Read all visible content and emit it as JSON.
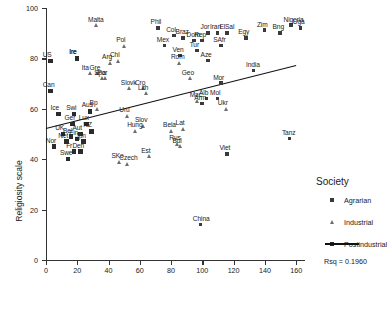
{
  "chart_data": {
    "type": "scatter",
    "title": "",
    "xlabel": "",
    "ylabel": "Religiosity scale",
    "xlim": [
      0,
      165
    ],
    "ylim": [
      0,
      100
    ],
    "xticks": [
      0,
      20,
      40,
      60,
      80,
      100,
      120,
      140,
      160
    ],
    "yticks": [
      0,
      20,
      40,
      60,
      80,
      100
    ],
    "grid": false,
    "legend_position": "right",
    "legend": {
      "title": "Society",
      "entries": [
        {
          "label": "Agrarian",
          "marker": "square-small"
        },
        {
          "label": "Industrial",
          "marker": "triangle"
        },
        {
          "label": "Postindustrial",
          "marker": "square-large"
        }
      ],
      "fit_line": true,
      "rsq_label": "Rsq = 0.1960"
    },
    "series": [
      {
        "name": "Agrarian",
        "marker": "square-small",
        "points": [
          {
            "label": "Phil",
            "x": 72,
            "y": 92
          },
          {
            "label": "Col",
            "x": 82,
            "y": 89
          },
          {
            "label": "Braz",
            "x": 88,
            "y": 88
          },
          {
            "label": "Dom",
            "x": 95,
            "y": 87
          },
          {
            "label": "Rep",
            "x": 100,
            "y": 87
          },
          {
            "label": "Jor",
            "x": 104,
            "y": 90
          },
          {
            "label": "Iran",
            "x": 110,
            "y": 90
          },
          {
            "label": "ElSal",
            "x": 116,
            "y": 90
          },
          {
            "label": "SAfr",
            "x": 112,
            "y": 85
          },
          {
            "label": "Egy",
            "x": 128,
            "y": 88
          },
          {
            "label": "Zim",
            "x": 140,
            "y": 91
          },
          {
            "label": "Bng",
            "x": 150,
            "y": 90
          },
          {
            "label": "Nigeria",
            "x": 157,
            "y": 93
          },
          {
            "label": "Uga",
            "x": 163,
            "y": 92
          },
          {
            "label": "Tur",
            "x": 97,
            "y": 83
          },
          {
            "label": "Mex",
            "x": 76,
            "y": 85
          },
          {
            "label": "Ven",
            "x": 86,
            "y": 81
          },
          {
            "label": "Aze",
            "x": 104,
            "y": 79
          },
          {
            "label": "India",
            "x": 133,
            "y": 75
          },
          {
            "label": "Mor",
            "x": 112,
            "y": 70
          },
          {
            "label": "Alb",
            "x": 103,
            "y": 64
          },
          {
            "label": "Mol",
            "x": 110,
            "y": 64
          },
          {
            "label": "Arm",
            "x": 100,
            "y": 62
          },
          {
            "label": "Viet",
            "x": 116,
            "y": 42
          },
          {
            "label": "China",
            "x": 99,
            "y": 14
          },
          {
            "label": "Tanz",
            "x": 156,
            "y": 48
          },
          {
            "label": "Ire",
            "x": 20,
            "y": 80
          }
        ]
      },
      {
        "name": "Industrial",
        "marker": "triangle",
        "points": [
          {
            "label": "Malta",
            "x": 32,
            "y": 93
          },
          {
            "label": "Pol",
            "x": 50,
            "y": 85
          },
          {
            "label": "Arg",
            "x": 41,
            "y": 78
          },
          {
            "label": "Chl",
            "x": 46,
            "y": 79
          },
          {
            "label": "Rom",
            "x": 85,
            "y": 78
          },
          {
            "label": "Geo",
            "x": 92,
            "y": 72
          },
          {
            "label": "Slovk",
            "x": 53,
            "y": 68
          },
          {
            "label": "Cro",
            "x": 62,
            "y": 68
          },
          {
            "label": "Lith",
            "x": 64,
            "y": 66
          },
          {
            "label": "Mac",
            "x": 97,
            "y": 63
          },
          {
            "label": "Ukr",
            "x": 115,
            "y": 60
          },
          {
            "label": "Uru",
            "x": 52,
            "y": 57
          },
          {
            "label": "Slov",
            "x": 62,
            "y": 53
          },
          {
            "label": "Hung",
            "x": 57,
            "y": 51
          },
          {
            "label": "Bela",
            "x": 80,
            "y": 51
          },
          {
            "label": "Lat",
            "x": 88,
            "y": 52
          },
          {
            "label": "Rus",
            "x": 84,
            "y": 46
          },
          {
            "label": "Bul",
            "x": 86,
            "y": 45
          },
          {
            "label": "Est",
            "x": 66,
            "y": 41
          },
          {
            "label": "SKo",
            "x": 47,
            "y": 39
          },
          {
            "label": "Czech",
            "x": 52,
            "y": 38
          },
          {
            "label": "Ita",
            "x": 28,
            "y": 74
          },
          {
            "label": "Gre",
            "x": 33,
            "y": 74
          },
          {
            "label": "Spa",
            "x": 36,
            "y": 72
          },
          {
            "label": "Por",
            "x": 38,
            "y": 72
          },
          {
            "label": "Bp",
            "x": 33,
            "y": 60
          }
        ]
      },
      {
        "name": "Postindustrial",
        "marker": "square-large",
        "points": [
          {
            "label": "US",
            "x": 3,
            "y": 79
          },
          {
            "label": "Can",
            "x": 3,
            "y": 67
          },
          {
            "label": "Ice",
            "x": 8,
            "y": 58
          },
          {
            "label": "Swi",
            "x": 18,
            "y": 58
          },
          {
            "label": "Aus",
            "x": 28,
            "y": 59
          },
          {
            "label": "Ger",
            "x": 17,
            "y": 54
          },
          {
            "label": "Lux",
            "x": 26,
            "y": 54
          },
          {
            "label": "NZ",
            "x": 29,
            "y": 51
          },
          {
            "label": "Nor",
            "x": 5,
            "y": 45
          },
          {
            "label": "Fr",
            "x": 18,
            "y": 43
          },
          {
            "label": "Den",
            "x": 22,
            "y": 43
          },
          {
            "label": "Swe",
            "x": 14,
            "y": 40
          },
          {
            "label": "UK",
            "x": 11,
            "y": 50
          },
          {
            "label": "Bel",
            "x": 16,
            "y": 49
          },
          {
            "label": "Net",
            "x": 13,
            "y": 47
          },
          {
            "label": "Fin",
            "x": 20,
            "y": 48
          },
          {
            "label": "Jpn",
            "x": 24,
            "y": 47
          },
          {
            "label": "Aut",
            "x": 22,
            "y": 50
          },
          {
            "label": "Ire2",
            "x": 20,
            "y": 80
          }
        ]
      }
    ],
    "fit_line": {
      "x0": 0,
      "y0": 52.5,
      "x1": 160,
      "y1": 77.5
    }
  }
}
